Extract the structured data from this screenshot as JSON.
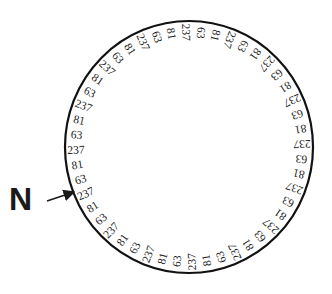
{
  "diagram": {
    "label": "N",
    "sequence_pattern": [
      "237",
      "63",
      "81"
    ],
    "label_count": 48,
    "start_angle_deg": -2,
    "direction": "clockwise",
    "circle": {
      "cx": 189,
      "cy": 147,
      "rx": 124,
      "ry": 126,
      "stroke": "#111111",
      "stroke_width": 2.2
    },
    "text_radius": 113,
    "arrow": {
      "x1": 47,
      "y1": 201,
      "x2": 74,
      "y2": 192
    },
    "colors": {
      "ink": "#1a1a1a",
      "background": "#ffffff"
    }
  }
}
